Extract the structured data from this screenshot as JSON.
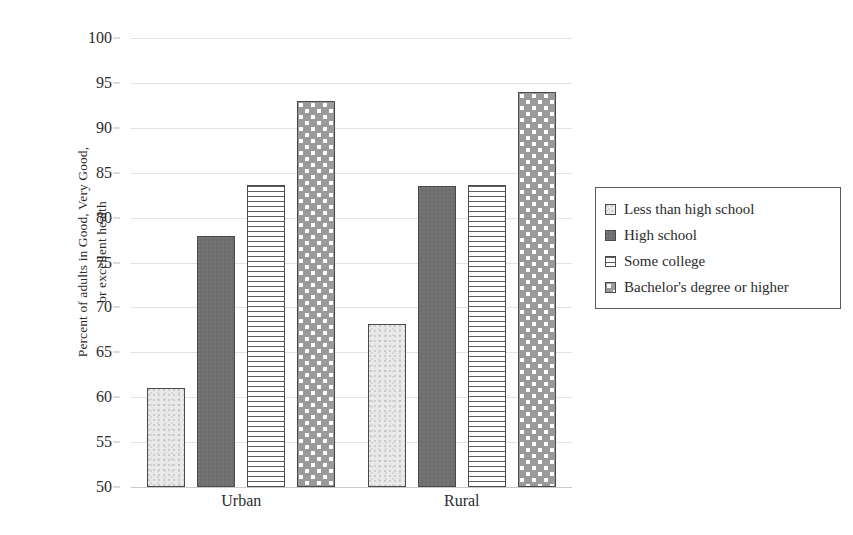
{
  "chart_data": {
    "type": "bar",
    "title": "",
    "xlabel": "",
    "ylabel": "Percent of adults in Good, Very Good,\nor excellent health",
    "categories": [
      "Urban",
      "Rural"
    ],
    "series": [
      {
        "name": "Less than high school",
        "values": [
          61.0,
          68.2
        ],
        "pattern": "light-speckle",
        "color": "#e9e9e9"
      },
      {
        "name": "High school",
        "values": [
          77.9,
          83.5
        ],
        "pattern": "dark-solid",
        "color": "#6e6e6e"
      },
      {
        "name": "Some college",
        "values": [
          83.6,
          83.6
        ],
        "pattern": "horizontal-lines",
        "color": "#ffffff"
      },
      {
        "name": "Bachelor's degree or higher",
        "values": [
          93.0,
          94.0
        ],
        "pattern": "polka-dots",
        "color": "#9a9a9a"
      }
    ],
    "ylim": [
      50,
      100
    ],
    "ytick_step": 5,
    "yticks": [
      50,
      55,
      60,
      65,
      70,
      75,
      80,
      85,
      90,
      95,
      100
    ],
    "ytick_labels": [
      "50",
      "55",
      "60",
      "65",
      "70",
      "75",
      "80",
      "85",
      "90",
      "95",
      "100"
    ],
    "grid": true,
    "grid_axis": "y",
    "legend_position": "right",
    "legend_border": true,
    "grid_color": "#e2e2e2",
    "axis_color": "#c9c9c9",
    "text_color": "#2b2b2b",
    "background": "#ffffff"
  }
}
